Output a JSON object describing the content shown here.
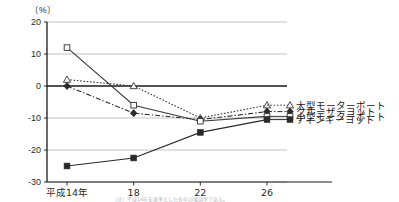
{
  "chart_data": {
    "type": "line",
    "title": "",
    "xlabel": "",
    "ylabel": "",
    "unit_label": "〔%〕",
    "categories": [
      "平成14年",
      "18",
      "22",
      "26"
    ],
    "ylim": [
      -30,
      20
    ],
    "yticks": [
      20,
      10,
      0,
      -10,
      -20,
      -30
    ],
    "ytick_labels": [
      "20",
      "10",
      "0",
      "-10",
      "-20",
      "-30"
    ],
    "grid": true,
    "legend_position": "right",
    "zero_line": true,
    "series": [
      {
        "name": "大型モーターボート",
        "marker": "open-triangle",
        "line_style": "dotted",
        "color": "#3a3a3a",
        "values": [
          2.0,
          0.0,
          -10.0,
          -6.0
        ]
      },
      {
        "name": "クルーザーヨット",
        "marker": "filled-diamond",
        "line_style": "dash-dot",
        "color": "#2a2a2a",
        "values": [
          0.0,
          -8.5,
          -10.5,
          -8.0
        ]
      },
      {
        "name": "小型モーターボート",
        "marker": "open-square",
        "line_style": "solid",
        "color": "#3a3a3a",
        "values": [
          12.0,
          -6.0,
          -11.0,
          -9.5
        ]
      },
      {
        "name": "ディンギーヨット",
        "marker": "filled-square",
        "line_style": "solid",
        "color": "#2a2a2a",
        "values": [
          -25.0,
          -22.5,
          -14.5,
          -10.5
        ]
      }
    ]
  },
  "footer": {
    "caption_fragment": "（注）平成14年を基準とした各年の増減率である。"
  }
}
